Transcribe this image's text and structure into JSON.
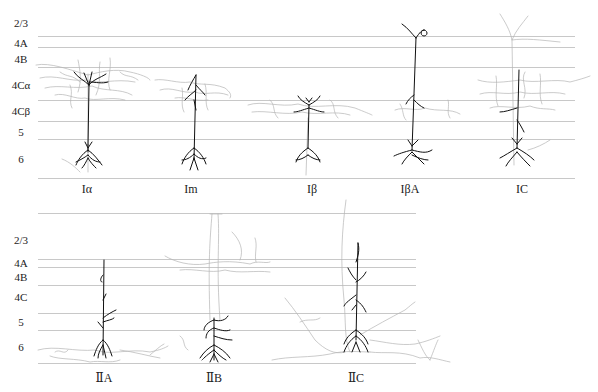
{
  "figure": {
    "panels": [
      {
        "id": "top",
        "layers": [
          "2/3",
          "4A",
          "4B",
          "4Cα",
          "4Cβ",
          "5",
          "6"
        ],
        "cells": [
          "Iα",
          "Im",
          "Iβ",
          "IβA",
          "IC"
        ]
      },
      {
        "id": "bottom",
        "layers": [
          "2/3",
          "4A",
          "4B",
          "4C",
          "5",
          "6"
        ],
        "cells": [
          "ⅡA",
          "ⅡB",
          "ⅡC"
        ]
      }
    ],
    "colors": {
      "dendrite": "#111111",
      "axon": "#aaaaaa",
      "layer_line": "#c8c8c8"
    }
  }
}
